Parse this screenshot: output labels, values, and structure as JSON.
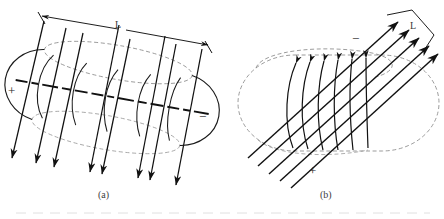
{
  "figure": {
    "background_color": "#ffffff",
    "ink_color": "#1a1a1a",
    "panels": [
      {
        "id": "a",
        "caption": "(a)",
        "caption_pos": [
          105,
          196
        ],
        "description": "Tilted torus with straight magnetic field arrows passing through, dimension line L across the top",
        "plus_label": "+",
        "plus_pos": [
          11,
          91
        ],
        "minus_label": "−",
        "minus_pos": [
          203,
          117
        ],
        "dimension_label": "L",
        "dimension_label_pos": [
          117,
          25
        ],
        "dimension_line": {
          "x1": 41,
          "y1": 15,
          "x2": 209,
          "y2": 45
        },
        "torus": {
          "cx": 112,
          "cy": 98,
          "rx": 93,
          "ry": 52,
          "tilt_deg": 10
        },
        "arrow_count": 6,
        "arrow_tilt_deg": 19
      },
      {
        "id": "b",
        "caption": "(b)",
        "caption_pos": [
          327,
          196
        ],
        "description": "Stadium shaped torus cross-section with vertical coil windings and a slanted beam of parallel arrows labelled L",
        "plus_label": "+",
        "plus_pos": [
          312,
          170
        ],
        "minus_label": "−",
        "minus_pos": [
          355,
          38
        ],
        "dimension_label": "L",
        "dimension_label_pos": [
          414,
          26
        ],
        "beam_count": 5,
        "beam_angle_deg": -33,
        "coil_count": 6
      }
    ],
    "colors": {
      "solid_stroke": "#1a1a1a",
      "dashed_stroke": "#6e6e6e",
      "bold_dashed_stroke": "#111111",
      "text": "#2b2b2b",
      "scan_line": "#d8d8d8"
    }
  }
}
